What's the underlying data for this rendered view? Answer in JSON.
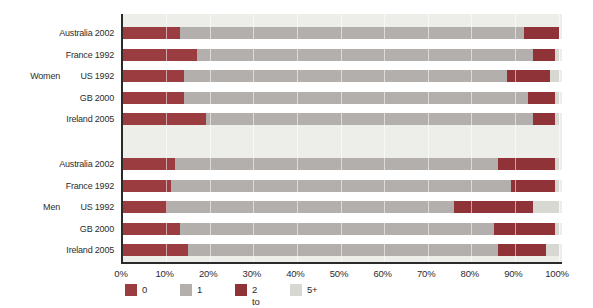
{
  "colors": {
    "plot_background": "#EDEDE9",
    "axis_line": "#2A2A2A",
    "gridline": "#FFFFFF",
    "text": "#2D2D2D",
    "gap_between_bars": "#FFFFFF"
  },
  "chart_data": {
    "type": "bar",
    "orientation": "horizontal",
    "stacked": true,
    "unit": "percent",
    "xlim": [
      0,
      100
    ],
    "grid": "vertical-white-lines-every-10",
    "legend_position": "bottom-left",
    "x_tick_labels": [
      "0%",
      "10%",
      "20%",
      "30%",
      "40%",
      "50%",
      "60%",
      "70%",
      "80%",
      "90%",
      "100%"
    ],
    "legend": [
      {
        "label": "0",
        "color": "#9B3C40"
      },
      {
        "label": "1",
        "color": "#B2AFAC"
      },
      {
        "label": "2 to 4",
        "color": "#8F3338"
      },
      {
        "label": "5+",
        "color": "#D8D8D2"
      }
    ],
    "groups": [
      {
        "label": "Women",
        "rows": [
          {
            "label": "Australia 2002",
            "values": [
              13,
              79,
              8,
              0
            ]
          },
          {
            "label": "France 1992",
            "values": [
              17,
              77,
              5,
              1
            ]
          },
          {
            "label": "US 1992",
            "values": [
              14,
              74,
              10,
              2
            ]
          },
          {
            "label": "GB 2000",
            "values": [
              14,
              79,
              6,
              1
            ]
          },
          {
            "label": "Ireland 2005",
            "values": [
              19,
              75,
              5,
              1
            ]
          }
        ]
      },
      {
        "label": "Men",
        "rows": [
          {
            "label": "Australia 2002",
            "values": [
              12,
              74,
              13,
              1
            ]
          },
          {
            "label": "France 1992",
            "values": [
              11,
              78,
              10,
              1
            ]
          },
          {
            "label": "US 1992",
            "values": [
              10,
              66,
              18,
              6
            ]
          },
          {
            "label": "GB 2000",
            "values": [
              13,
              72,
              14,
              1
            ]
          },
          {
            "label": "Ireland 2005",
            "values": [
              15,
              71,
              11,
              3
            ]
          }
        ]
      }
    ]
  }
}
